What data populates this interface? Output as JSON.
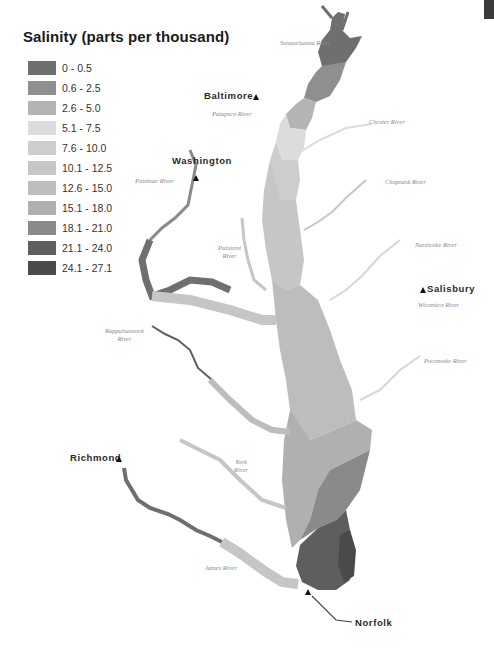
{
  "title": "Salinity (parts per thousand)",
  "legend": [
    {
      "label": "0 - 0.5",
      "color": "#6f6f6f"
    },
    {
      "label": "0.6 - 2.5",
      "color": "#8f8f8f"
    },
    {
      "label": "2.6 - 5.0",
      "color": "#b4b4b4"
    },
    {
      "label": "5.1 - 7.5",
      "color": "#dcdcdc"
    },
    {
      "label": "7.6 - 10.0",
      "color": "#cdcdcd"
    },
    {
      "label": "10.1 - 12.5",
      "color": "#c6c6c6"
    },
    {
      "label": "12.6 - 15.0",
      "color": "#bdbdbd"
    },
    {
      "label": "15.1 - 18.0",
      "color": "#b0b0b0"
    },
    {
      "label": "18.1 - 21.0",
      "color": "#8a8a8a"
    },
    {
      "label": "21.1 - 24.0",
      "color": "#5e5e5e"
    },
    {
      "label": "24.1 - 27.1",
      "color": "#4a4a4a"
    }
  ],
  "cities": {
    "baltimore": "Baltimore",
    "washington": "Washington",
    "salisbury": "Salisbury",
    "richmond": "Richmond",
    "norfolk": "Norfolk"
  },
  "rivers": {
    "susquehanna": "Susquehanna River",
    "patapsco": "Patapsco River",
    "chester": "Chester River",
    "choptank": "Choptank River",
    "potomac": "Potomac River",
    "patuxent_1": "Patuxent",
    "patuxent_2": "River",
    "nanticoke": "Nanticoke River",
    "wicomico": "Wicomico River",
    "rappahannock_1": "Rappahannock",
    "rappahannock_2": "River",
    "pocomoke": "Pocomoke River",
    "york_1": "York",
    "york_2": "River",
    "james": "James River"
  }
}
